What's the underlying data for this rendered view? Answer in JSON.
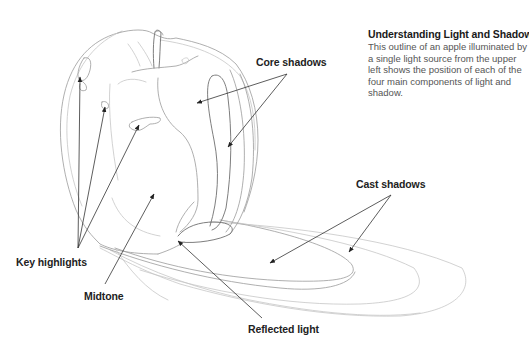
{
  "caption": {
    "title": "Understanding Light and Shadow",
    "body": "This outline of an apple illuminated by a single light source from the upper left shows the position of each of the four main components of light and shadow."
  },
  "colors": {
    "label_text": "#222222",
    "caption_body": "#555555",
    "arrow": "#333333",
    "sketch_line": "#9a9a9a"
  },
  "labels": [
    {
      "id": "core-shadows",
      "text": "Core shadows",
      "x": 256,
      "y": 56,
      "arrows": [
        {
          "from": [
            287,
            74
          ],
          "to": [
            197,
            103
          ]
        },
        {
          "from": [
            287,
            74
          ],
          "to": [
            228,
            147
          ]
        }
      ]
    },
    {
      "id": "key-highlights",
      "text": "Key highlights",
      "x": 16,
      "y": 256,
      "arrows": [
        {
          "from": [
            78,
            248
          ],
          "to": [
            80,
            77
          ]
        },
        {
          "from": [
            78,
            248
          ],
          "to": [
            105,
            107
          ]
        },
        {
          "from": [
            78,
            248
          ],
          "to": [
            139,
            125
          ]
        }
      ]
    },
    {
      "id": "midtone",
      "text": "Midtone",
      "x": 84,
      "y": 290,
      "arrows": [
        {
          "from": [
            105,
            284
          ],
          "to": [
            154,
            194
          ]
        }
      ]
    },
    {
      "id": "reflected-light",
      "text": "Reflected light",
      "x": 248,
      "y": 323,
      "arrows": [
        {
          "from": [
            262,
            318
          ],
          "to": [
            178,
            241
          ]
        }
      ]
    },
    {
      "id": "cast-shadows",
      "text": "Cast shadows",
      "x": 356,
      "y": 178,
      "arrows": [
        {
          "from": [
            391,
            195
          ],
          "to": [
            270,
            263
          ]
        },
        {
          "from": [
            391,
            195
          ],
          "to": [
            349,
            252
          ]
        }
      ]
    }
  ]
}
